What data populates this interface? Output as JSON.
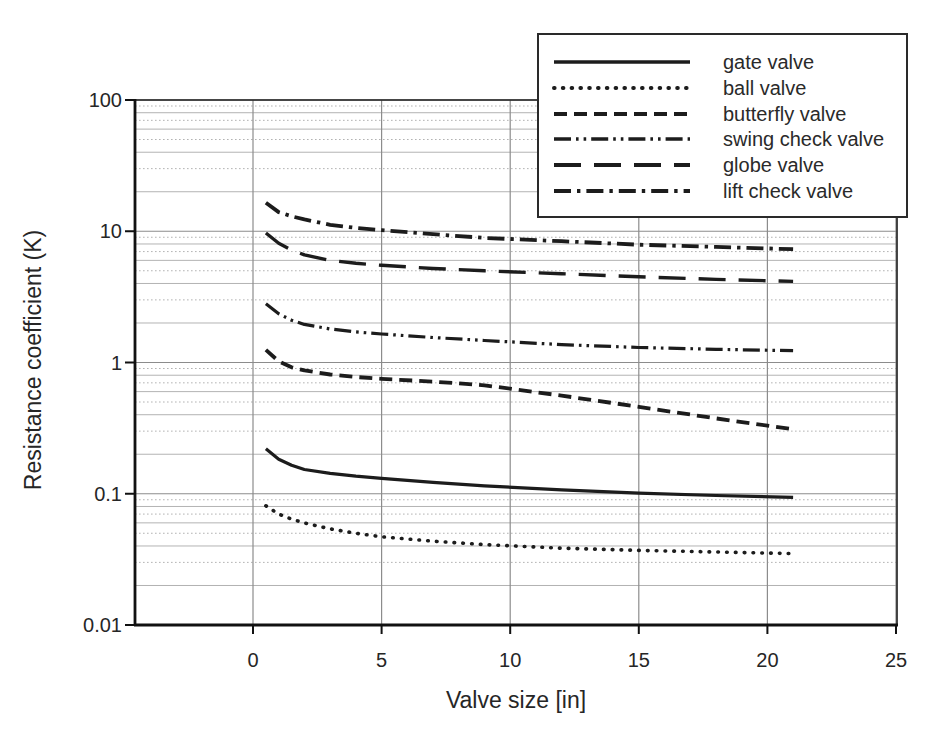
{
  "colors": {
    "curve": "#1c1c1c",
    "grid_minor": "#b3b3b3",
    "grid_major": "#8c8c8c",
    "frame": "#333333",
    "axis": "#111111",
    "text": "#262626",
    "background": "#ffffff"
  },
  "chart_data": {
    "type": "line",
    "title": "",
    "xlabel": "Valve size [in]",
    "ylabel": "Resistance coefficient (K)",
    "x_ticks": [
      0,
      5,
      10,
      15,
      20,
      25
    ],
    "x_tick_labels": [
      "0",
      "5",
      "10",
      "15",
      "20",
      "25"
    ],
    "y_ticks": [
      100,
      10,
      1,
      0.1,
      0.01
    ],
    "y_tick_labels": [
      "100",
      "10",
      "1",
      "0.1",
      "0.01"
    ],
    "y_scale": "log",
    "ylim": [
      0.01,
      100
    ],
    "xlim_drawn": [
      -4.6,
      25
    ],
    "grid": "major vertical lines at every x tick; log minor + major horizontal lines",
    "legend_position": "top-right",
    "x": [
      0.5,
      1,
      1.5,
      2,
      3,
      4,
      5,
      7,
      9,
      12,
      15,
      18,
      21
    ],
    "series": [
      {
        "name": "gate valve",
        "style": "solid",
        "y": [
          0.22,
          0.183,
          0.165,
          0.153,
          0.143,
          0.136,
          0.131,
          0.122,
          0.115,
          0.107,
          0.101,
          0.097,
          0.094
        ]
      },
      {
        "name": "ball valve",
        "style": "dotted",
        "y": [
          0.081,
          0.07,
          0.064,
          0.06,
          0.054,
          0.05,
          0.047,
          0.0435,
          0.041,
          0.0385,
          0.037,
          0.036,
          0.035
        ]
      },
      {
        "name": "butterfly valve",
        "style": "dashed",
        "y": [
          1.25,
          1.02,
          0.92,
          0.87,
          0.81,
          0.775,
          0.75,
          0.715,
          0.67,
          0.56,
          0.46,
          0.375,
          0.31
        ]
      },
      {
        "name": "swing check valve",
        "style": "dash-dot-dot",
        "y": [
          2.8,
          2.35,
          2.1,
          1.95,
          1.8,
          1.71,
          1.65,
          1.55,
          1.47,
          1.37,
          1.3,
          1.26,
          1.23
        ]
      },
      {
        "name": "globe valve",
        "style": "long-dash",
        "y": [
          9.7,
          8.1,
          7.2,
          6.6,
          6.0,
          5.7,
          5.5,
          5.2,
          5.0,
          4.75,
          4.5,
          4.3,
          4.15
        ]
      },
      {
        "name": "lift check valve",
        "style": "dash-dot",
        "y": [
          16.5,
          14.0,
          13.0,
          12.3,
          11.2,
          10.6,
          10.2,
          9.5,
          8.9,
          8.4,
          7.9,
          7.6,
          7.3
        ]
      }
    ]
  }
}
